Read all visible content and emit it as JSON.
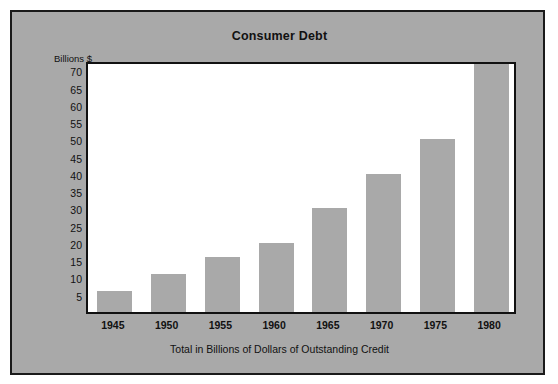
{
  "chart_data": {
    "type": "bar",
    "title": "Consumer Debt",
    "xlabel": "Total in Billions of Dollars of Outstanding Credit",
    "ylabel": "Billions $",
    "categories": [
      "1945",
      "1950",
      "1955",
      "1960",
      "1965",
      "1970",
      "1975",
      "1980"
    ],
    "values": [
      6,
      11,
      16,
      20,
      30,
      40,
      50,
      78
    ],
    "value_notes": {
      "1980": "bar extends past the top of the plot frame (clipped above 73)"
    },
    "ylim": [
      0,
      73
    ],
    "y_ticks": [
      5,
      10,
      15,
      20,
      25,
      30,
      35,
      40,
      45,
      50,
      55,
      60,
      65,
      70
    ],
    "y_tick_labels": [
      "5",
      "10",
      "15",
      "20",
      "25",
      "30",
      "35",
      "40",
      "45",
      "50",
      "55",
      "60",
      "65",
      "70"
    ],
    "grid": false,
    "legend": false,
    "legend_position": "none",
    "bar_color": "#a9a9a9",
    "plot_background": "#ffffff",
    "figure_background": "#a9a9a9",
    "axis_color": "#111111",
    "text_color": "#111111"
  }
}
